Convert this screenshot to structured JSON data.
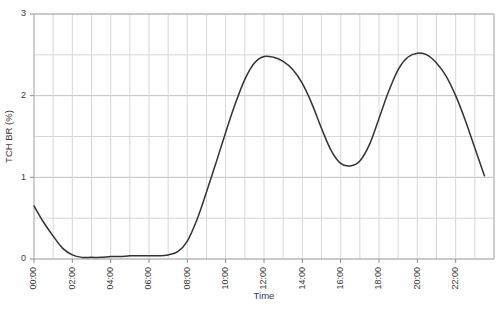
{
  "chart_data": {
    "type": "line",
    "title": "",
    "xlabel": "Time",
    "ylabel": "TCH BR (%)",
    "xlim": [
      0,
      24
    ],
    "ylim": [
      0,
      3
    ],
    "yticks": [
      0,
      1,
      2,
      3
    ],
    "ytick_labels": [
      "0",
      "1",
      "2",
      "3"
    ],
    "y_minor_step": 0.5,
    "x_minor_step": 1,
    "xticks": [
      0,
      2,
      4,
      6,
      8,
      10,
      12,
      14,
      16,
      18,
      20,
      22
    ],
    "xtick_labels": [
      "00:00",
      "02:00",
      "04:00",
      "06:00",
      "08:00",
      "10:00",
      "12:00",
      "14:00",
      "16:00",
      "18:00",
      "20:00",
      "22:00"
    ],
    "xtick_label_rotation": -90,
    "grid": true,
    "legend": false,
    "series": [
      {
        "name": "TCH BR (%)",
        "color": "#333333",
        "line_width": 1.5,
        "x": [
          0,
          0.5,
          1,
          1.5,
          2,
          2.5,
          3,
          3.5,
          4,
          4.5,
          5,
          5.5,
          6,
          6.5,
          7,
          7.5,
          8,
          8.5,
          9,
          9.5,
          10,
          10.5,
          11,
          11.5,
          12,
          12.5,
          13,
          13.5,
          14,
          14.5,
          15,
          15.5,
          16,
          16.5,
          17,
          17.5,
          18,
          18.5,
          19,
          19.5,
          20,
          20.5,
          21,
          21.5,
          22,
          22.5,
          23,
          23.5
        ],
        "values": [
          0.65,
          0.45,
          0.28,
          0.13,
          0.05,
          0.02,
          0.02,
          0.02,
          0.03,
          0.03,
          0.04,
          0.04,
          0.04,
          0.04,
          0.05,
          0.09,
          0.22,
          0.48,
          0.82,
          1.18,
          1.55,
          1.9,
          2.2,
          2.4,
          2.48,
          2.47,
          2.42,
          2.32,
          2.15,
          1.9,
          1.6,
          1.33,
          1.17,
          1.14,
          1.2,
          1.4,
          1.72,
          2.05,
          2.32,
          2.47,
          2.52,
          2.5,
          2.4,
          2.24,
          2.0,
          1.7,
          1.36,
          1.02
        ]
      }
    ]
  },
  "plot": {
    "left": 34,
    "top": 14,
    "right": 494,
    "bottom": 259,
    "axis_color": "#b4b4b4",
    "grid_major_color": "#c0c0c0",
    "grid_minor_color": "#d6d6d6",
    "tick_color": "#8c8c8c",
    "background": "#ffffff"
  }
}
